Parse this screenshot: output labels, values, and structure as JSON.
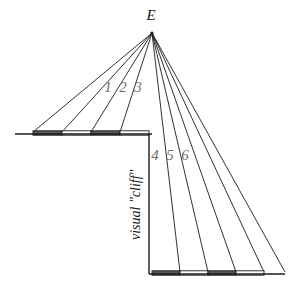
{
  "figure": {
    "background_color": "#ffffff",
    "line_color": "#1a1a1a",
    "label_color": "#1a1a1a",
    "ray_label_color": "#6e6e6e",
    "checker_dark_color": "#595959",
    "checker_light_color": "#ffffff",
    "eye_label": "E",
    "cliff_caption": "visual \"cliff\""
  },
  "ray_labels": {
    "upper": [
      "1",
      "2",
      "3"
    ],
    "lower": [
      "4",
      "5",
      "6"
    ]
  },
  "geometry": {
    "apex": {
      "x": 152,
      "y": 33
    },
    "eye_label_pos": {
      "x": 151,
      "y": 20
    },
    "upper_surface": {
      "y": 134,
      "x_start": 15,
      "x_end": 152
    },
    "lower_surface": {
      "y": 274,
      "x_start": 149,
      "x_end": 285
    },
    "cliff_line": {
      "x": 149,
      "y_top": 134,
      "y_bottom": 274
    },
    "upper_ray_endpoints": [
      33,
      62,
      91,
      120
    ],
    "lower_ray_endpoints": [
      180,
      208,
      236,
      264,
      285
    ],
    "upper_checker_segments": [
      {
        "x1": 33,
        "x2": 62,
        "shade": "dark"
      },
      {
        "x1": 62,
        "x2": 91,
        "shade": "light"
      },
      {
        "x1": 91,
        "x2": 120,
        "shade": "dark"
      },
      {
        "x1": 120,
        "x2": 149,
        "shade": "light"
      }
    ],
    "lower_checker_segments": [
      {
        "x1": 152,
        "x2": 180,
        "shade": "dark"
      },
      {
        "x1": 180,
        "x2": 208,
        "shade": "light"
      },
      {
        "x1": 208,
        "x2": 236,
        "shade": "dark"
      },
      {
        "x1": 236,
        "x2": 264,
        "shade": "light"
      }
    ],
    "upper_label_positions": [
      {
        "x": 108,
        "y": 92
      },
      {
        "x": 123,
        "y": 92
      },
      {
        "x": 138,
        "y": 92
      }
    ],
    "lower_label_positions": [
      {
        "x": 155,
        "y": 160
      },
      {
        "x": 170,
        "y": 160
      },
      {
        "x": 185,
        "y": 160
      }
    ],
    "cliff_caption_pos": {
      "x": 140,
      "y": 240
    }
  }
}
